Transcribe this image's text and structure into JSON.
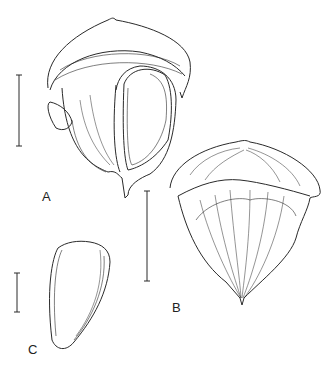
{
  "figure": {
    "panels": [
      {
        "id": "A",
        "label": "A",
        "subject": "fruit with seed, side view"
      },
      {
        "id": "B",
        "label": "B",
        "subject": "fruit, whole view"
      },
      {
        "id": "C",
        "label": "C",
        "subject": "seed"
      }
    ],
    "scale_bars": [
      "scale-bar-A",
      "scale-bar-B",
      "scale-bar-C"
    ],
    "line_color": "#2a2a2a"
  }
}
